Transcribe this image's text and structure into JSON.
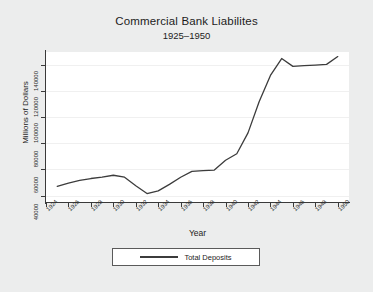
{
  "chart_data": {
    "type": "line",
    "title": "Commercial Bank Liabilites",
    "subtitle": "1925–1950",
    "xlabel": "Year",
    "ylabel": "Millions of Dollars",
    "grid": true,
    "legend_position": "bottom",
    "xlim": [
      1924,
      1951
    ],
    "ylim": [
      35000,
      150000
    ],
    "x_tick_labels": [
      "1924",
      "1926",
      "1928",
      "1930",
      "1932",
      "1934",
      "1936",
      "1938",
      "1940",
      "1942",
      "1944",
      "1946",
      "1948",
      "1950"
    ],
    "x_ticks": [
      1924,
      1926,
      1928,
      1930,
      1932,
      1934,
      1936,
      1938,
      1940,
      1942,
      1944,
      1946,
      1948,
      1950
    ],
    "y_tick_labels": [
      "40000",
      "60000",
      "80000",
      "100000",
      "120000",
      "140000"
    ],
    "y_ticks": [
      40000,
      60000,
      80000,
      100000,
      120000,
      140000
    ],
    "series": [
      {
        "name": "Total Deposits",
        "color": "#3c3c3c",
        "x": [
          1925,
          1926,
          1927,
          1928,
          1929,
          1930,
          1931,
          1932,
          1933,
          1934,
          1935,
          1936,
          1937,
          1938,
          1939,
          1940,
          1941,
          1942,
          1943,
          1944,
          1945,
          1946,
          1947,
          1948,
          1949,
          1950
        ],
        "values": [
          47000,
          49500,
          51500,
          53000,
          54000,
          55500,
          54000,
          47500,
          41500,
          43500,
          48500,
          54000,
          58500,
          59000,
          59500,
          67000,
          72000,
          88000,
          112000,
          132000,
          145000,
          139000,
          139500,
          140000,
          140500,
          146500
        ]
      }
    ]
  },
  "legend": {
    "entries": [
      {
        "label": "Total Deposits"
      }
    ]
  }
}
